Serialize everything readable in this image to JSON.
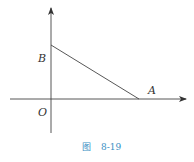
{
  "figure": {
    "caption_prefix": "图",
    "caption_number": "8-19",
    "points": {
      "origin": "O",
      "point_a": "A",
      "point_b": "B"
    },
    "colors": {
      "lines": "#333333",
      "caption": "#3a8fc4"
    }
  }
}
